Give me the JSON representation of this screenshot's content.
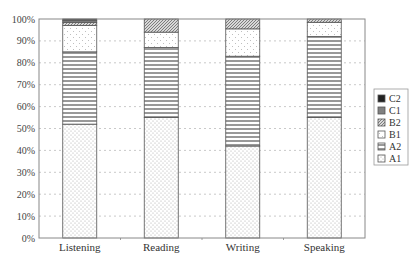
{
  "chart_data": {
    "type": "bar",
    "stacked": true,
    "percent": true,
    "title": "",
    "xlabel": "",
    "ylabel": "",
    "ylim": [
      0,
      100
    ],
    "yticks": [
      "0%",
      "10%",
      "20%",
      "30%",
      "40%",
      "50%",
      "60%",
      "70%",
      "80%",
      "90%",
      "100%"
    ],
    "grid": "horizontal dashed",
    "legend_position": "right",
    "categories": [
      "Listening",
      "Reading",
      "Writing",
      "Speaking"
    ],
    "series": [
      {
        "name": "A1",
        "pattern": "dots",
        "values": [
          52,
          55,
          42,
          55
        ]
      },
      {
        "name": "A2",
        "pattern": "horizontal-lines",
        "values": [
          33,
          32,
          41,
          37
        ]
      },
      {
        "name": "B1",
        "pattern": "sparse-dots",
        "values": [
          12,
          7,
          12.5,
          6.5
        ]
      },
      {
        "name": "B2",
        "pattern": "diagonal-hatch",
        "values": [
          1.5,
          6,
          4.5,
          1.5
        ]
      },
      {
        "name": "C1",
        "pattern": "gray-fill",
        "values": [
          1,
          0,
          0,
          0
        ]
      },
      {
        "name": "C2",
        "pattern": "black-fill",
        "values": [
          0.5,
          0,
          0,
          0
        ]
      }
    ],
    "legend": [
      "C2",
      "C1",
      "B2",
      "B1",
      "A2",
      "A1"
    ]
  }
}
